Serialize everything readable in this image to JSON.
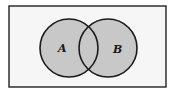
{
  "diagram": {
    "type": "venn",
    "universe": {
      "x": 9,
      "y": 6,
      "width": 157,
      "height": 81,
      "fill": "#f6f6f6",
      "stroke": "#222222"
    },
    "sets": [
      {
        "id": "A",
        "label": "A",
        "cx": 69,
        "cy": 48,
        "r": 29,
        "fill": "#c8c8c8",
        "label_x": 58,
        "label_y": 52
      },
      {
        "id": "B",
        "label": "B",
        "cx": 108,
        "cy": 48,
        "r": 29,
        "fill": "#c8c8c8",
        "label_x": 113,
        "label_y": 53
      }
    ],
    "shaded_region": "A ∪ B",
    "stroke_color": "#1a1a1a"
  }
}
